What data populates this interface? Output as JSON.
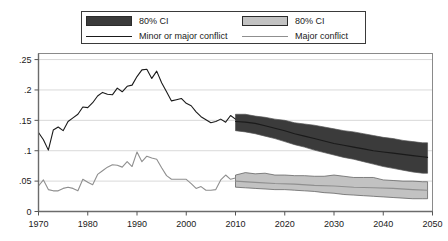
{
  "legend": {
    "items": [
      {
        "label": "80% CI",
        "swatch": "dark-band-swatch",
        "kind": "band"
      },
      {
        "label": "80% CI",
        "swatch": "light-band-swatch",
        "kind": "band"
      },
      {
        "label": "Minor or major conflict",
        "swatch": "dark-line-swatch",
        "kind": "line"
      },
      {
        "label": "Major conflict",
        "swatch": "light-line-swatch",
        "kind": "line"
      }
    ]
  },
  "colors": {
    "dark_band": "#3b3b3b",
    "light_band": "#c2c2c2",
    "dark_line": "#1a1a1a",
    "light_line": "#8f8f8f",
    "grid": "#d9d9d9",
    "frame": "#8a8a8a",
    "axis": "#555555",
    "background": "#ffffff"
  },
  "chart_data": {
    "type": "line",
    "title": "",
    "xlabel": "",
    "ylabel": "",
    "xlim": [
      1970,
      2050
    ],
    "ylim": [
      0,
      0.26
    ],
    "grid": true,
    "legend_position": "top",
    "xticks": [
      1970,
      1980,
      1990,
      2000,
      2010,
      2020,
      2030,
      2040,
      2050
    ],
    "xtick_labels": [
      "1970",
      "1980",
      "1990",
      "2000",
      "2010",
      "2020",
      "2030",
      "2040",
      "2050"
    ],
    "yticks": [
      0,
      0.05,
      0.1,
      0.15,
      0.2,
      0.25
    ],
    "ytick_labels": [
      "0",
      ".05",
      ".1",
      ".15",
      ".2",
      ".25"
    ],
    "forecast_start": 2010,
    "series": [
      {
        "name": "Minor or major conflict",
        "type": "line",
        "color": "#1a1a1a",
        "x": [
          1970,
          1971,
          1972,
          1973,
          1974,
          1975,
          1976,
          1977,
          1978,
          1979,
          1980,
          1981,
          1982,
          1983,
          1984,
          1985,
          1986,
          1987,
          1988,
          1989,
          1990,
          1991,
          1992,
          1993,
          1994,
          1995,
          1996,
          1997,
          1998,
          1999,
          2000,
          2001,
          2002,
          2003,
          2004,
          2005,
          2006,
          2007,
          2008,
          2009,
          2010
        ],
        "y": [
          0.13,
          0.118,
          0.101,
          0.134,
          0.139,
          0.133,
          0.148,
          0.154,
          0.16,
          0.172,
          0.171,
          0.179,
          0.19,
          0.196,
          0.193,
          0.192,
          0.203,
          0.197,
          0.206,
          0.208,
          0.222,
          0.233,
          0.234,
          0.219,
          0.231,
          0.212,
          0.197,
          0.182,
          0.184,
          0.186,
          0.178,
          0.174,
          0.164,
          0.156,
          0.151,
          0.146,
          0.148,
          0.152,
          0.147,
          0.158,
          0.152
        ]
      },
      {
        "name": "Major conflict",
        "type": "line",
        "color": "#8f8f8f",
        "x": [
          1970,
          1971,
          1972,
          1973,
          1974,
          1975,
          1976,
          1977,
          1978,
          1979,
          1980,
          1981,
          1982,
          1983,
          1984,
          1985,
          1986,
          1987,
          1988,
          1989,
          1990,
          1991,
          1992,
          1993,
          1994,
          1995,
          1996,
          1997,
          1998,
          1999,
          2000,
          2001,
          2002,
          2003,
          2004,
          2005,
          2006,
          2007,
          2008,
          2009,
          2010
        ],
        "y": [
          0.042,
          0.052,
          0.036,
          0.034,
          0.034,
          0.038,
          0.04,
          0.038,
          0.034,
          0.053,
          0.048,
          0.044,
          0.061,
          0.067,
          0.073,
          0.077,
          0.076,
          0.073,
          0.082,
          0.074,
          0.098,
          0.082,
          0.091,
          0.088,
          0.086,
          0.072,
          0.059,
          0.053,
          0.053,
          0.053,
          0.053,
          0.046,
          0.038,
          0.041,
          0.035,
          0.035,
          0.036,
          0.052,
          0.06,
          0.053,
          0.055
        ]
      },
      {
        "name": "Minor or major conflict forecast",
        "type": "line",
        "color": "#1a1a1a",
        "x": [
          2010,
          2012,
          2014,
          2016,
          2018,
          2020,
          2022,
          2024,
          2026,
          2028,
          2030,
          2032,
          2034,
          2036,
          2038,
          2040,
          2042,
          2044,
          2046,
          2048,
          2049
        ],
        "y": [
          0.148,
          0.147,
          0.145,
          0.141,
          0.137,
          0.133,
          0.128,
          0.124,
          0.12,
          0.116,
          0.112,
          0.109,
          0.106,
          0.103,
          0.1,
          0.098,
          0.096,
          0.094,
          0.092,
          0.09,
          0.089
        ]
      },
      {
        "name": "Major conflict forecast",
        "type": "line",
        "color": "#8f8f8f",
        "x": [
          2010,
          2014,
          2018,
          2022,
          2026,
          2030,
          2034,
          2038,
          2042,
          2046,
          2049
        ],
        "y": [
          0.05,
          0.048,
          0.046,
          0.045,
          0.043,
          0.042,
          0.04,
          0.039,
          0.038,
          0.036,
          0.035
        ]
      }
    ],
    "bands": [
      {
        "name": "Minor or major conflict 80% CI",
        "color": "#3b3b3b",
        "x": [
          2010,
          2012,
          2014,
          2016,
          2018,
          2020,
          2022,
          2024,
          2026,
          2028,
          2030,
          2032,
          2034,
          2036,
          2038,
          2040,
          2042,
          2044,
          2046,
          2048,
          2049
        ],
        "upper": [
          0.16,
          0.16,
          0.157,
          0.155,
          0.152,
          0.15,
          0.146,
          0.144,
          0.142,
          0.139,
          0.136,
          0.133,
          0.131,
          0.128,
          0.125,
          0.122,
          0.12,
          0.117,
          0.115,
          0.113,
          0.113
        ],
        "lower": [
          0.133,
          0.131,
          0.128,
          0.124,
          0.12,
          0.115,
          0.11,
          0.106,
          0.101,
          0.097,
          0.093,
          0.089,
          0.086,
          0.082,
          0.078,
          0.074,
          0.071,
          0.068,
          0.065,
          0.063,
          0.063
        ]
      },
      {
        "name": "Major conflict 80% CI",
        "color": "#c2c2c2",
        "x": [
          2010,
          2012,
          2014,
          2016,
          2018,
          2020,
          2022,
          2024,
          2026,
          2028,
          2030,
          2032,
          2034,
          2036,
          2038,
          2040,
          2042,
          2044,
          2046,
          2048,
          2049
        ],
        "upper": [
          0.06,
          0.064,
          0.062,
          0.063,
          0.06,
          0.06,
          0.059,
          0.059,
          0.058,
          0.058,
          0.06,
          0.058,
          0.056,
          0.056,
          0.056,
          0.052,
          0.051,
          0.05,
          0.05,
          0.049,
          0.049
        ],
        "lower": [
          0.04,
          0.039,
          0.038,
          0.037,
          0.036,
          0.036,
          0.035,
          0.034,
          0.033,
          0.031,
          0.03,
          0.028,
          0.027,
          0.026,
          0.025,
          0.024,
          0.023,
          0.022,
          0.021,
          0.021,
          0.021
        ]
      }
    ]
  }
}
